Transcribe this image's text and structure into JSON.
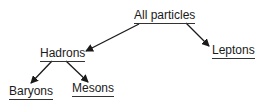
{
  "diagram": {
    "type": "tree",
    "nodes": {
      "root": {
        "label": "All particles"
      },
      "hadrons": {
        "label": "Hadrons"
      },
      "leptons": {
        "label": "Leptons"
      },
      "baryons": {
        "label": "Baryons"
      },
      "mesons": {
        "label": "Mesons"
      }
    },
    "edges": [
      {
        "from": "All particles",
        "to": "Hadrons"
      },
      {
        "from": "All particles",
        "to": "Leptons"
      },
      {
        "from": "Hadrons",
        "to": "Baryons"
      },
      {
        "from": "Hadrons",
        "to": "Mesons"
      }
    ],
    "colors": {
      "ink": "#1a1a1a",
      "background": "#ffffff"
    }
  }
}
